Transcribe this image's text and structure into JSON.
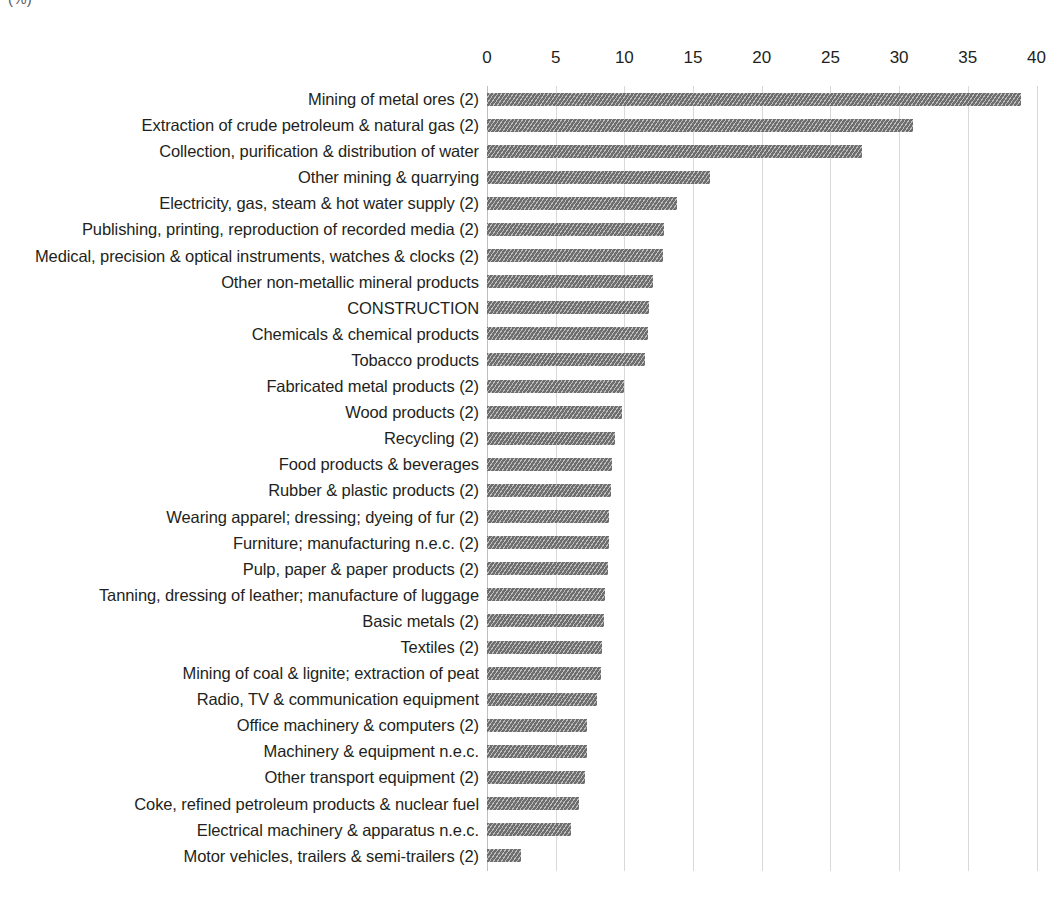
{
  "unit_label": "(%)",
  "chart_data": {
    "type": "bar",
    "orientation": "horizontal",
    "title": "",
    "subtitle": "",
    "xlabel": "(%)",
    "ylabel": "",
    "xlim": [
      0,
      40
    ],
    "xticks": [
      0,
      5,
      10,
      15,
      20,
      25,
      30,
      35,
      40
    ],
    "xtick_labels": [
      "0",
      "5",
      "10",
      "15",
      "20",
      "25",
      "30",
      "35",
      "40"
    ],
    "grid": true,
    "legend": null,
    "bar_color": "#6e6e6e",
    "bar_pattern": "diagonal-hatch",
    "categories": [
      "Mining of metal ores (2)",
      "Extraction of crude petroleum & natural gas (2)",
      "Collection, purification & distribution of water",
      "Other mining & quarrying",
      "Electricity, gas, steam & hot water supply (2)",
      "Publishing, printing, reproduction of recorded media (2)",
      "Medical, precision & optical instruments, watches & clocks (2)",
      "Other non-metallic mineral products",
      "CONSTRUCTION",
      "Chemicals & chemical products",
      "Tobacco products",
      "Fabricated metal products (2)",
      "Wood products (2)",
      "Recycling (2)",
      "Food products & beverages",
      "Rubber & plastic products (2)",
      "Wearing apparel; dressing; dyeing of fur (2)",
      "Furniture; manufacturing n.e.c. (2)",
      "Pulp, paper & paper products (2)",
      "Tanning, dressing of leather; manufacture of luggage",
      "Basic metals (2)",
      "Textiles (2)",
      "Mining of coal & lignite; extraction of peat",
      "Radio, TV & communication equipment",
      "Office machinery & computers (2)",
      "Machinery & equipment n.e.c.",
      "Other transport equipment (2)",
      "Coke, refined petroleum products & nuclear fuel",
      "Electrical machinery & apparatus n.e.c.",
      "Motor vehicles, trailers & semi-trailers (2)"
    ],
    "values": [
      38.9,
      31.0,
      27.3,
      16.2,
      13.8,
      12.9,
      12.8,
      12.1,
      11.8,
      11.7,
      11.5,
      10.0,
      9.8,
      9.3,
      9.1,
      9.0,
      8.9,
      8.9,
      8.8,
      8.6,
      8.5,
      8.4,
      8.3,
      8.0,
      7.3,
      7.3,
      7.1,
      6.7,
      6.1,
      2.5
    ]
  }
}
